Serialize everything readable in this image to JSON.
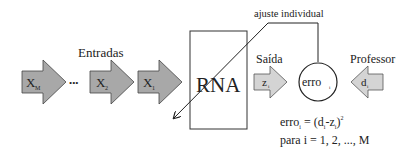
{
  "labels": {
    "inputs": "Entradas",
    "network": "RNA",
    "output": "Saída",
    "teacher": "Professor",
    "adjust": "ajuste individual",
    "ellipsis": "•••"
  },
  "inputs": [
    {
      "base": "X",
      "sub": "M"
    },
    {
      "base": "X",
      "sub": "2"
    },
    {
      "base": "X",
      "sub": "1"
    }
  ],
  "output_arrow": {
    "base": "z",
    "sub": "i"
  },
  "teacher_arrow": {
    "base": "d",
    "sub": "i"
  },
  "error_node": {
    "base": "erro",
    "sub": "i"
  },
  "formula": {
    "line1_lhs": "erro",
    "line1_lhs_sub": "i",
    "line1_eq": " = (d",
    "line1_d_sub": "i",
    "line1_minus": "-z",
    "line1_z_sub": "i",
    "line1_close": ")",
    "line1_exp": "2",
    "line2": "para i = 1, 2, ..., M"
  },
  "colors": {
    "arrow_dark": "#a8a8a8",
    "arrow_light": "#d4d4d4",
    "stroke": "#333333"
  }
}
